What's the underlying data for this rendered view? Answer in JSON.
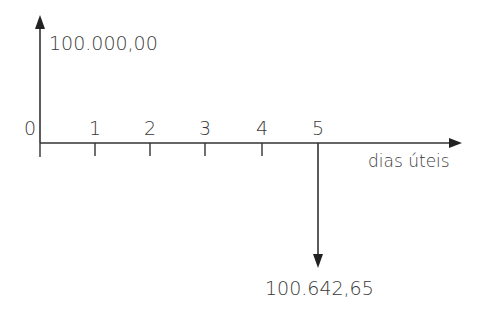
{
  "diagram": {
    "type": "cash-flow-timeline",
    "axis": {
      "label": "dias úteis",
      "ticks": [
        "0",
        "1",
        "2",
        "3",
        "4",
        "5"
      ]
    },
    "flows": [
      {
        "period": "0",
        "direction": "up",
        "value": "100.000,00"
      },
      {
        "period": "5",
        "direction": "down",
        "value": "100.642,65"
      }
    ],
    "colors": {
      "line": "#333333",
      "text": "#3a3a3a"
    }
  }
}
